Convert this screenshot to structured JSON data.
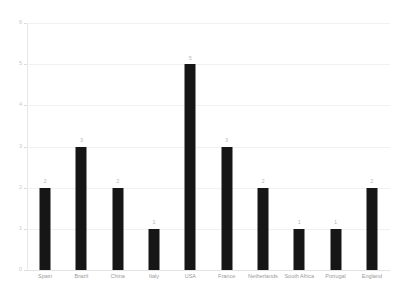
{
  "chart_data": {
    "type": "bar",
    "title": "",
    "subtitle": "",
    "xlabel": "",
    "ylabel": "",
    "categories": [
      "Spain",
      "Brazil",
      "China",
      "Italy",
      "USA",
      "France",
      "Netherlands",
      "South Africa",
      "Portugal",
      "England"
    ],
    "values": [
      2,
      3,
      2,
      1,
      5,
      3,
      2,
      1,
      1,
      2
    ],
    "data_labels": [
      "2",
      "3",
      "2",
      "1",
      "5",
      "3",
      "2",
      "1",
      "1",
      "2"
    ],
    "ylim": [
      0,
      6
    ],
    "y_ticks": [
      0,
      1,
      2,
      3,
      4,
      5,
      6
    ],
    "y_tick_labels": [
      "0",
      "1",
      "2",
      "3",
      "4",
      "5",
      "6"
    ],
    "grid": true,
    "grid_axis": "y",
    "legend": false,
    "legend_position": "none",
    "bar_color": "#161616",
    "grid_color": "#f1f1f1",
    "axis_color": "#e8e8e8",
    "tick_label_color": "#c9c9c9",
    "category_label_color": "#9a9a9a",
    "data_label_color": "#b8b8b8",
    "background_color": "#ffffff"
  }
}
